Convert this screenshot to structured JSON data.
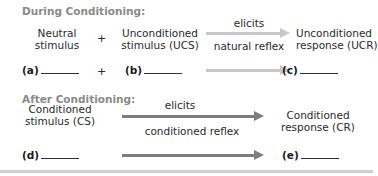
{
  "during": {
    "title": "During Conditioning:",
    "neutral": [
      "Neutral",
      "stimulus"
    ],
    "plus": "+",
    "ucs": [
      "Unconditioned",
      "stimulus (UCS)"
    ],
    "arrow_top": "elicits",
    "arrow_bottom": "natural reflex",
    "ucr": [
      "Unconditioned",
      "response (UCR)"
    ],
    "blank_a": "(a)",
    "blank_b": "(b)",
    "blank_c": "(c)",
    "arrow_color": "#c8c8c8"
  },
  "after": {
    "title": "After Conditioning:",
    "cs": [
      "Conditioned",
      "stimulus (CS)"
    ],
    "arrow_top": "elicits",
    "arrow_bottom": "conditioned reflex",
    "cr": [
      "Conditioned",
      "response (CR)"
    ],
    "blank_d": "(d)",
    "blank_e": "(e)",
    "arrow_color": "#7d7d7d"
  }
}
